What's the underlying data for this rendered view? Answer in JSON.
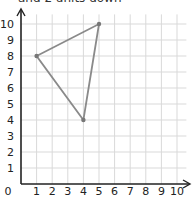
{
  "caption": "and 2 units down",
  "chart_data": {
    "type": "scatter",
    "title": "",
    "xlabel": "",
    "ylabel": "",
    "xlim": [
      0,
      10
    ],
    "ylim": [
      0,
      10
    ],
    "grid": true,
    "x_ticks": [
      "0",
      "1",
      "2",
      "3",
      "4",
      "5",
      "6",
      "7",
      "8",
      "9",
      "10"
    ],
    "y_ticks": [
      "1",
      "2",
      "3",
      "4",
      "5",
      "6",
      "7",
      "8",
      "9",
      "10"
    ],
    "shape": "triangle",
    "vertices": [
      {
        "x": 1,
        "y": 8
      },
      {
        "x": 5,
        "y": 10
      },
      {
        "x": 4,
        "y": 4
      }
    ],
    "colors": {
      "shape": "#8a8a8a",
      "grid": "#d9d9d9",
      "axis": "#222222"
    }
  }
}
